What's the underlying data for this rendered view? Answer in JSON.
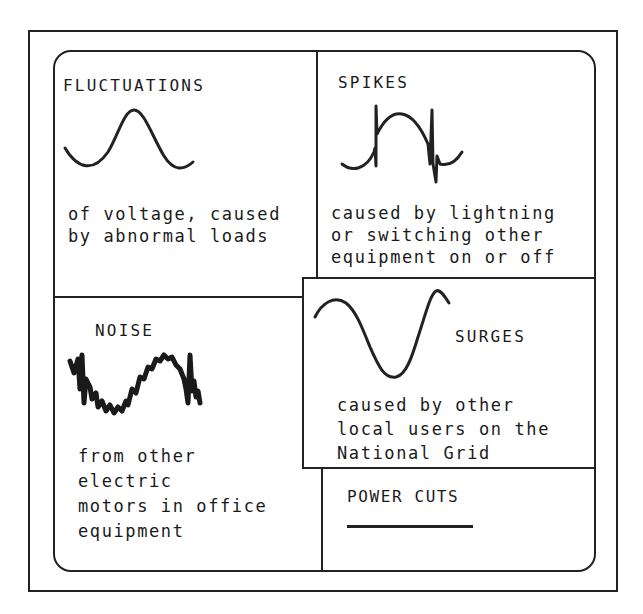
{
  "diagram": {
    "panels": [
      {
        "id": "fluctuations",
        "title": "FLUCTUATIONS",
        "description_lines": [
          "of voltage, caused",
          "by abnormal loads"
        ],
        "waveform": "smooth-sine-wave-icon"
      },
      {
        "id": "spikes",
        "title": "SPIKES",
        "description_lines": [
          "caused by lightning",
          "or switching other",
          "equipment on or off"
        ],
        "waveform": "sine-wave-with-spikes-icon"
      },
      {
        "id": "noise",
        "title": "NOISE",
        "description_lines": [
          "from other",
          "electric",
          "motors in office",
          "equipment"
        ],
        "waveform": "noisy-sine-wave-icon"
      },
      {
        "id": "surges",
        "title": "SURGES",
        "description_lines": [
          "caused by other",
          "local users on the",
          "National Grid"
        ],
        "waveform": "large-amplitude-wave-icon"
      },
      {
        "id": "power_cuts",
        "title": "POWER CUTS",
        "description_lines": [],
        "waveform": "flat-line-icon"
      }
    ],
    "colors": {
      "ink": "#222222",
      "background": "#ffffff"
    }
  }
}
